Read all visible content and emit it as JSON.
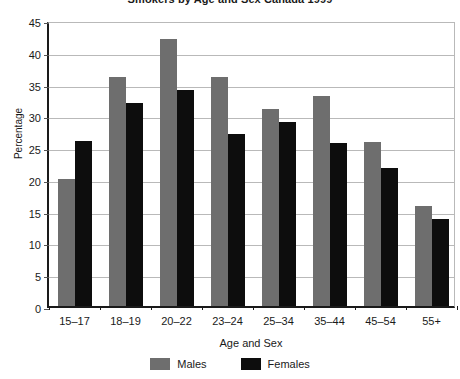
{
  "chart_data": {
    "type": "bar",
    "title": "Smokers by Age and Sex Canada 1999",
    "xlabel": "Age and Sex",
    "ylabel": "Percentage",
    "categories": [
      "15–17",
      "18–19",
      "20–22",
      "23–24",
      "25–34",
      "35–44",
      "45–54",
      "55+"
    ],
    "series": [
      {
        "name": "Males",
        "color": "#6e6e6e",
        "values": [
          20,
          36,
          42,
          36,
          31,
          33,
          25.8,
          15.8
        ]
      },
      {
        "name": "Females",
        "color": "#0d0d0d",
        "values": [
          26,
          32,
          34,
          27,
          29,
          25.7,
          21.7,
          13.7
        ]
      }
    ],
    "ylim": [
      0,
      45
    ],
    "ytick_values": [
      0,
      5,
      10,
      15,
      20,
      25,
      30,
      35,
      40,
      45
    ],
    "ytick_labels": [
      "0",
      "5",
      "10",
      "15",
      "20",
      "25",
      "30",
      "35",
      "40",
      "45"
    ],
    "grid": true,
    "grid_axis": "y",
    "legend_position": "bottom-center",
    "legend_orientation": "horizontal"
  },
  "colors": {
    "males": "#6e6e6e",
    "females": "#0d0d0d",
    "axis": "#1a1a1a",
    "gridline": "#b9b9b9",
    "background": "#ffffff"
  }
}
